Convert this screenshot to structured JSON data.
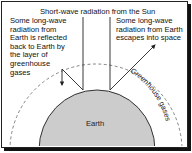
{
  "diagram": {
    "title": "Short-wave radiation from the Sun",
    "left_annotation": "Some long-wave radiation from Earth is reflected back to Earth by the layer of greenhouse gases",
    "right_annotation": "Some long-wave radiation from Earth escapes into space",
    "earth_label": "Earth",
    "layer_label": "Greenhouse gases",
    "colors": {
      "earth_fill": "#cccccc",
      "lines": "#222222",
      "dashed_layer": "#777777"
    }
  }
}
